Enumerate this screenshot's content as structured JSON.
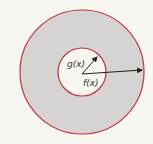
{
  "diagram": {
    "type": "washer-cross-section",
    "labels": {
      "inner_radius": "g(x)",
      "outer_radius": "f(x)"
    },
    "colors": {
      "background": "#f7f6f1",
      "annulus_fill": "#d6d4d2",
      "circle_stroke": "#c8323c",
      "arrow": "#222222"
    }
  }
}
